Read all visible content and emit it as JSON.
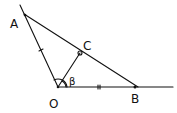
{
  "diagram": {
    "type": "geometry",
    "points": [
      {
        "id": "A",
        "label": "A",
        "x": 25,
        "y": 15
      },
      {
        "id": "O",
        "label": "O",
        "x": 58,
        "y": 87
      },
      {
        "id": "B",
        "label": "B",
        "x": 135,
        "y": 87
      },
      {
        "id": "C",
        "label": "C",
        "x": 80,
        "y": 53
      }
    ],
    "angle_label": "β",
    "segments": [
      "AO",
      "OB",
      "AB",
      "OC"
    ],
    "notes": {
      "equal_marks": [
        "AO",
        "OB"
      ],
      "right_angle_at": "C",
      "angle_marked_at": "O"
    }
  }
}
